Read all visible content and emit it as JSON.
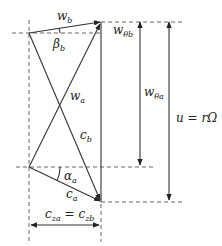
{
  "diagram": {
    "type": "velocity-triangles",
    "labels": {
      "w_b": {
        "base": "w",
        "sub": "b"
      },
      "w_theta_b": {
        "base": "w",
        "sub": "θb"
      },
      "beta_b": {
        "base": "β",
        "sub": "b"
      },
      "w_a": {
        "base": "w",
        "sub": "a"
      },
      "w_theta_a": {
        "base": "w",
        "sub": "θa"
      },
      "c_b": {
        "base": "c",
        "sub": "b"
      },
      "alpha_a": {
        "base": "α",
        "sub": "a"
      },
      "c_a": {
        "base": "c",
        "sub": "a"
      },
      "u": "u = rΩ",
      "cz_left": {
        "base": "c",
        "sub": "za"
      },
      "cz_eq": " = ",
      "cz_right": {
        "base": "c",
        "sub": "zb"
      }
    },
    "colors": {
      "line": "#333333",
      "dashed": "#555555"
    }
  }
}
